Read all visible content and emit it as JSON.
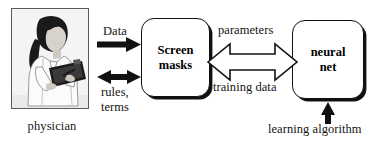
{
  "diagram": {
    "background_color": "#ffffff",
    "ink_color": "#111111",
    "actor": {
      "image_name": "physician-photo",
      "caption": "physician"
    },
    "nodes": [
      {
        "id": "screen-masks",
        "line1": "Screen",
        "line2": "masks",
        "shape": "rounded-rect-with-shadow"
      },
      {
        "id": "neural-net",
        "line1": "neural",
        "line2": "net",
        "shape": "rounded-rect-with-shadow"
      }
    ],
    "edges": [
      {
        "id": "data",
        "label": "Data",
        "style": "solid-filled-arrow",
        "direction": "right",
        "from": "physician",
        "to": "screen-masks"
      },
      {
        "id": "rules-terms",
        "label_line1": "rules,",
        "label_line2": "terms",
        "style": "solid-filled-arrow",
        "direction": "bidirectional",
        "from": "physician",
        "to": "screen-masks"
      },
      {
        "id": "parameters-training-data",
        "label_top": "parameters",
        "label_bottom": "training data",
        "style": "hollow-block-arrow",
        "direction": "bidirectional",
        "from": "screen-masks",
        "to": "neural-net"
      },
      {
        "id": "learning-algorithm",
        "label": "learning algorithm",
        "style": "solid-filled-arrow",
        "direction": "up",
        "from": "learning-algorithm",
        "to": "neural-net"
      }
    ]
  }
}
